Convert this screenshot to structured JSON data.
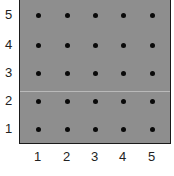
{
  "grid": {
    "rows": 5,
    "cols": 5,
    "background_color": "#8e8e8e",
    "dot_color": "#0a0a0a"
  },
  "axes": {
    "x_labels": [
      "1",
      "2",
      "3",
      "4",
      "5"
    ],
    "y_labels": [
      "5",
      "4",
      "3",
      "2",
      "1"
    ]
  }
}
